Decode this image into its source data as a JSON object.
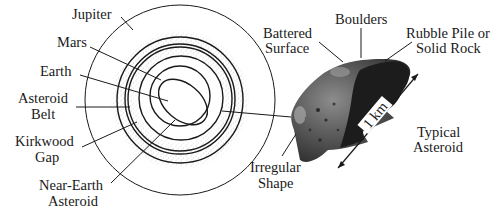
{
  "figure": {
    "orbit_labels": {
      "jupiter": "Jupiter",
      "mars": "Mars",
      "earth": "Earth",
      "asteroid_belt_line1": "Asteroid",
      "asteroid_belt_line2": "Belt",
      "kirkwood_line1": "Kirkwood",
      "kirkwood_line2": "Gap",
      "nea_line1": "Near-Earth",
      "nea_line2": "Asteroid"
    },
    "asteroid_labels": {
      "battered_line1": "Battered",
      "battered_line2": "Surface",
      "boulders": "Boulders",
      "rubble_line1": "Rubble Pile or",
      "rubble_line2": "Solid Rock",
      "scale": "1 km",
      "typical_line1": "Typical",
      "typical_line2": "Asteroid",
      "irregular_line1": "Irregular",
      "irregular_line2": "Shape"
    },
    "colors": {
      "ink": "#1a1a1a",
      "belt_dots": "#8a8a8a",
      "asteroid_dark": "#1c1c1c",
      "asteroid_mid": "#5a5a5a",
      "asteroid_light": "#9a9a9a"
    }
  }
}
